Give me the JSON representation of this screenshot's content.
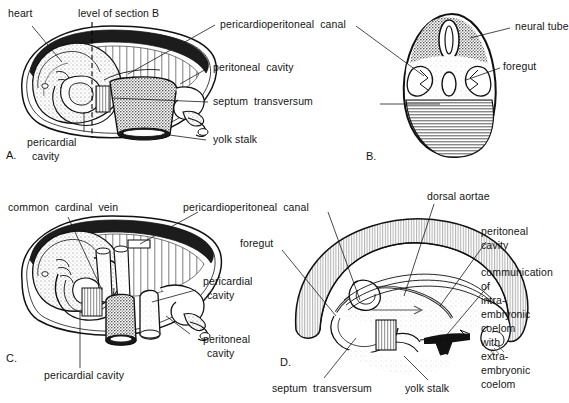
{
  "figure": {
    "background_color": "#ffffff",
    "ink_color": "#141414"
  },
  "panels": [
    {
      "id": "A",
      "id_label": "A.",
      "view": "lateral view of embryo with pericardial cavity and yolk stalk",
      "labels": [
        {
          "name": "heart",
          "text": "heart"
        },
        {
          "name": "level-of-section-b",
          "text": "level of section B"
        },
        {
          "name": "pericardioperitoneal-canal",
          "text": "pericardioperitoneal  canal"
        },
        {
          "name": "peritoneal-cavity",
          "text": "peritoneal  cavity"
        },
        {
          "name": "septum-transversum",
          "text": "septum  transversum"
        },
        {
          "name": "yolk-stalk",
          "text": "yolk stalk"
        },
        {
          "name": "pericardial-cavity-line1",
          "text": "pericardial"
        },
        {
          "name": "pericardial-cavity-line2",
          "text": "cavity"
        }
      ]
    },
    {
      "id": "B",
      "id_label": "B.",
      "view": "transverse section through embryo at level of section B",
      "labels": [
        {
          "name": "neural-tube",
          "text": "neural tube"
        },
        {
          "name": "foregut",
          "text": "foregut"
        }
      ]
    },
    {
      "id": "C",
      "id_label": "C.",
      "view": "lateral view showing common cardinal vein and pericardial cavity",
      "labels": [
        {
          "name": "common-cardinal-vein",
          "text": "common  cardinal  vein"
        },
        {
          "name": "pericardioperitoneal-canal",
          "text": "pericardioperitoneal  canal"
        },
        {
          "name": "pericardial-cavity-line1",
          "text": "pericardial"
        },
        {
          "name": "pericardial-cavity-line2",
          "text": "cavity"
        },
        {
          "name": "peritoneal-cavity-line1",
          "text": "peritoneal"
        },
        {
          "name": "peritoneal-cavity-line2",
          "text": "cavity"
        },
        {
          "name": "pericardial-cavity-bottom",
          "text": "pericardial cavity"
        }
      ]
    },
    {
      "id": "D",
      "id_label": "D.",
      "view": "sagittal section showing communication of intraembryonic with extraembryonic coelom",
      "labels": [
        {
          "name": "dorsal-aortae",
          "text": "dorsal aortae"
        },
        {
          "name": "foregut",
          "text": "foregut"
        },
        {
          "name": "peritoneal-cavity-line1",
          "text": "peritoneal"
        },
        {
          "name": "peritoneal-cavity-line2",
          "text": "cavity"
        },
        {
          "name": "communication-l1",
          "text": "communication"
        },
        {
          "name": "communication-l2",
          "text": "of"
        },
        {
          "name": "communication-l3",
          "text": "intra-"
        },
        {
          "name": "communication-l4",
          "text": "embryonic"
        },
        {
          "name": "communication-l5",
          "text": "coelom"
        },
        {
          "name": "communication-l6",
          "text": "with"
        },
        {
          "name": "communication-l7",
          "text": "extra-"
        },
        {
          "name": "communication-l8",
          "text": "embryonic"
        },
        {
          "name": "communication-l9",
          "text": "coelom"
        },
        {
          "name": "septum-transversum",
          "text": "septum  transversum"
        },
        {
          "name": "yolk-stalk",
          "text": "yolk stalk"
        }
      ]
    }
  ]
}
